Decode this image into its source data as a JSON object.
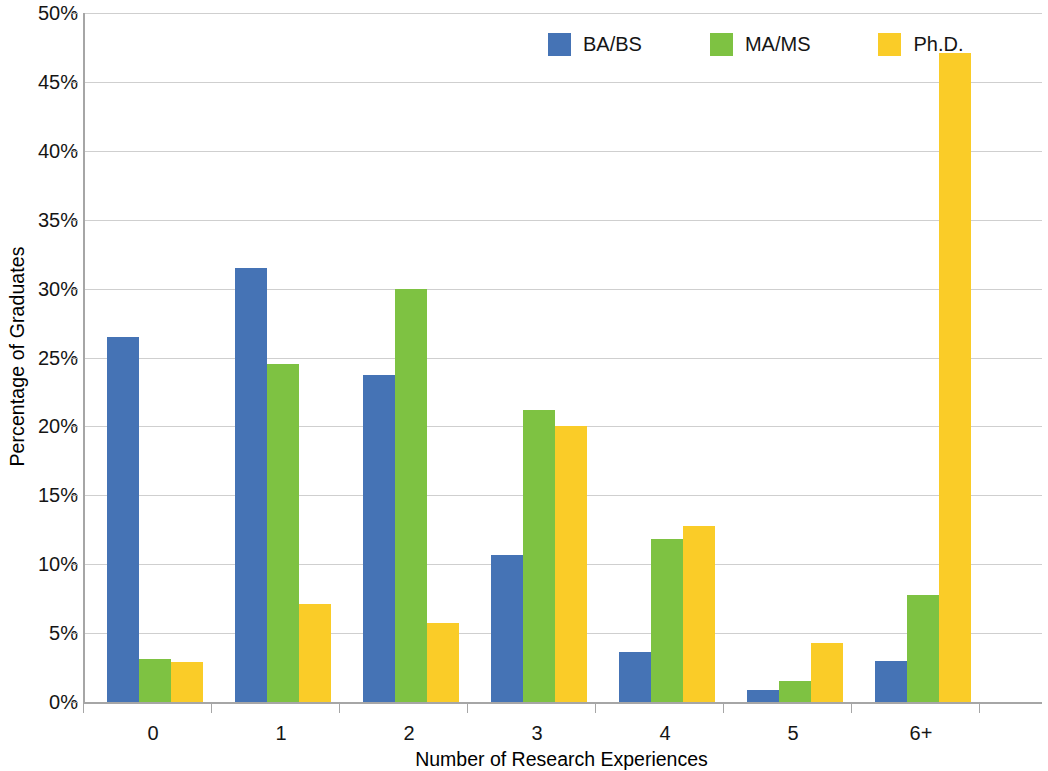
{
  "chart_data": {
    "type": "bar",
    "title": "",
    "xlabel": "Number of Research Experiences",
    "ylabel": "Percentage of Graduates",
    "categories": [
      "0",
      "1",
      "2",
      "3",
      "4",
      "5",
      "6+"
    ],
    "ylim": [
      0,
      50
    ],
    "ytick_step": 5,
    "ytick_labels": [
      "0%",
      "5%",
      "10%",
      "15%",
      "20%",
      "25%",
      "30%",
      "35%",
      "40%",
      "45%",
      "50%"
    ],
    "ytick_values": [
      0,
      5,
      10,
      15,
      20,
      25,
      30,
      35,
      40,
      45,
      50
    ],
    "grid": true,
    "legend_position": "top-right",
    "series": [
      {
        "name": "BA/BS",
        "color": "#4573b5",
        "values": [
          26.5,
          31.5,
          23.7,
          10.7,
          3.6,
          0.9,
          3.0
        ]
      },
      {
        "name": "MA/MS",
        "color": "#7ec242",
        "values": [
          3.1,
          24.5,
          30.0,
          21.2,
          11.8,
          1.5,
          7.8
        ]
      },
      {
        "name": "Ph.D.",
        "color": "#facc28",
        "values": [
          2.9,
          7.1,
          5.7,
          20.0,
          12.8,
          4.3,
          47.1
        ]
      }
    ]
  }
}
